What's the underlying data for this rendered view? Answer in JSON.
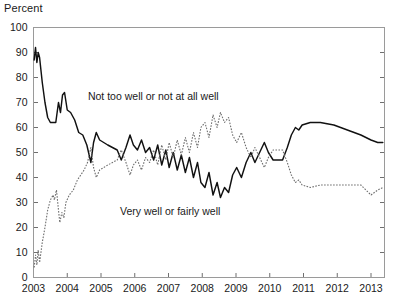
{
  "chart_data": {
    "type": "line",
    "title": "",
    "ylabel": "Percent",
    "xlabel": "",
    "ylim": [
      0,
      100
    ],
    "xlim": [
      2003.0,
      2013.4
    ],
    "grid": false,
    "legend_position": "inline-annotations",
    "y_ticks": [
      0,
      10,
      20,
      30,
      40,
      50,
      60,
      70,
      80,
      90,
      100
    ],
    "y_tick_labels": [
      "0",
      "10",
      "20",
      "30",
      "40",
      "50",
      "60",
      "70",
      "80",
      "90",
      "100"
    ],
    "x_ticks": [
      2003,
      2004,
      2005,
      2006,
      2007,
      2008,
      2009,
      2010,
      2011,
      2012,
      2013
    ],
    "x_tick_labels": [
      "2003",
      "2004",
      "2005",
      "2006",
      "2007",
      "2008",
      "2009",
      "2010",
      "2011",
      "2012",
      "2013"
    ],
    "annotations": [
      {
        "text": "Not too well or not at all well",
        "x": 2006.55,
        "y": 71
      },
      {
        "text": "Very well or fairly well",
        "x": 2007.05,
        "y": 25
      }
    ],
    "series": [
      {
        "name": "Not too well or not at all well",
        "style": "solid",
        "color": "#111111",
        "points": [
          [
            2003.02,
            87
          ],
          [
            2003.06,
            92
          ],
          [
            2003.1,
            86
          ],
          [
            2003.14,
            90
          ],
          [
            2003.18,
            88
          ],
          [
            2003.26,
            78
          ],
          [
            2003.34,
            70
          ],
          [
            2003.42,
            64
          ],
          [
            2003.5,
            62
          ],
          [
            2003.58,
            62
          ],
          [
            2003.66,
            62
          ],
          [
            2003.74,
            70
          ],
          [
            2003.8,
            66
          ],
          [
            2003.86,
            73
          ],
          [
            2003.92,
            74
          ],
          [
            2004.0,
            67
          ],
          [
            2004.1,
            66
          ],
          [
            2004.22,
            63
          ],
          [
            2004.34,
            58
          ],
          [
            2004.46,
            57
          ],
          [
            2004.58,
            53
          ],
          [
            2004.7,
            46
          ],
          [
            2004.78,
            54
          ],
          [
            2004.86,
            58
          ],
          [
            2004.96,
            55
          ],
          [
            2005.08,
            54
          ],
          [
            2005.2,
            53
          ],
          [
            2005.34,
            52
          ],
          [
            2005.48,
            51
          ],
          [
            2005.6,
            47
          ],
          [
            2005.74,
            52
          ],
          [
            2005.86,
            57
          ],
          [
            2005.96,
            53
          ],
          [
            2006.08,
            51
          ],
          [
            2006.2,
            55
          ],
          [
            2006.32,
            50
          ],
          [
            2006.44,
            52
          ],
          [
            2006.56,
            47
          ],
          [
            2006.68,
            53
          ],
          [
            2006.8,
            45
          ],
          [
            2006.92,
            51
          ],
          [
            2007.02,
            44
          ],
          [
            2007.14,
            50
          ],
          [
            2007.26,
            43
          ],
          [
            2007.38,
            49
          ],
          [
            2007.5,
            42
          ],
          [
            2007.62,
            48
          ],
          [
            2007.74,
            40
          ],
          [
            2007.86,
            46
          ],
          [
            2007.96,
            38
          ],
          [
            2008.08,
            36
          ],
          [
            2008.2,
            42
          ],
          [
            2008.32,
            33
          ],
          [
            2008.44,
            38
          ],
          [
            2008.54,
            32
          ],
          [
            2008.66,
            36
          ],
          [
            2008.78,
            34
          ],
          [
            2008.9,
            41
          ],
          [
            2009.02,
            44
          ],
          [
            2009.16,
            40
          ],
          [
            2009.3,
            46
          ],
          [
            2009.44,
            50
          ],
          [
            2009.56,
            46
          ],
          [
            2009.7,
            50
          ],
          [
            2009.84,
            54
          ],
          [
            2009.96,
            50
          ],
          [
            2010.1,
            47
          ],
          [
            2010.24,
            47
          ],
          [
            2010.38,
            47
          ],
          [
            2010.52,
            52
          ],
          [
            2010.64,
            57
          ],
          [
            2010.76,
            60
          ],
          [
            2010.86,
            59
          ],
          [
            2010.96,
            61
          ],
          [
            2011.2,
            62
          ],
          [
            2011.5,
            62
          ],
          [
            2011.9,
            61
          ],
          [
            2012.3,
            59
          ],
          [
            2012.7,
            57
          ],
          [
            2013.0,
            55
          ],
          [
            2013.2,
            54
          ],
          [
            2013.35,
            54
          ]
        ]
      },
      {
        "name": "Very well or fairly well",
        "style": "dotted",
        "color": "#6e6e6e",
        "points": [
          [
            2003.02,
            4
          ],
          [
            2003.06,
            9
          ],
          [
            2003.1,
            5
          ],
          [
            2003.14,
            11
          ],
          [
            2003.18,
            6
          ],
          [
            2003.26,
            14
          ],
          [
            2003.34,
            20
          ],
          [
            2003.42,
            27
          ],
          [
            2003.5,
            31
          ],
          [
            2003.58,
            33
          ],
          [
            2003.62,
            31
          ],
          [
            2003.68,
            35
          ],
          [
            2003.74,
            27
          ],
          [
            2003.78,
            22
          ],
          [
            2003.84,
            26
          ],
          [
            2003.9,
            24
          ],
          [
            2003.96,
            30
          ],
          [
            2004.06,
            33
          ],
          [
            2004.18,
            35
          ],
          [
            2004.3,
            39
          ],
          [
            2004.4,
            41
          ],
          [
            2004.5,
            43
          ],
          [
            2004.6,
            46
          ],
          [
            2004.7,
            52
          ],
          [
            2004.78,
            44
          ],
          [
            2004.86,
            40
          ],
          [
            2004.96,
            43
          ],
          [
            2005.08,
            44
          ],
          [
            2005.2,
            45
          ],
          [
            2005.34,
            46
          ],
          [
            2005.48,
            47
          ],
          [
            2005.6,
            51
          ],
          [
            2005.74,
            46
          ],
          [
            2005.86,
            41
          ],
          [
            2005.96,
            45
          ],
          [
            2006.08,
            47
          ],
          [
            2006.2,
            43
          ],
          [
            2006.32,
            48
          ],
          [
            2006.44,
            46
          ],
          [
            2006.56,
            51
          ],
          [
            2006.68,
            45
          ],
          [
            2006.8,
            53
          ],
          [
            2006.92,
            47
          ],
          [
            2007.02,
            54
          ],
          [
            2007.14,
            48
          ],
          [
            2007.26,
            55
          ],
          [
            2007.38,
            49
          ],
          [
            2007.5,
            56
          ],
          [
            2007.62,
            50
          ],
          [
            2007.74,
            58
          ],
          [
            2007.86,
            52
          ],
          [
            2007.96,
            60
          ],
          [
            2008.08,
            62
          ],
          [
            2008.2,
            56
          ],
          [
            2008.32,
            65
          ],
          [
            2008.44,
            60
          ],
          [
            2008.54,
            66
          ],
          [
            2008.66,
            62
          ],
          [
            2008.78,
            64
          ],
          [
            2008.9,
            57
          ],
          [
            2009.02,
            54
          ],
          [
            2009.16,
            58
          ],
          [
            2009.3,
            52
          ],
          [
            2009.44,
            48
          ],
          [
            2009.56,
            52
          ],
          [
            2009.7,
            48
          ],
          [
            2009.84,
            44
          ],
          [
            2009.96,
            48
          ],
          [
            2010.1,
            51
          ],
          [
            2010.24,
            51
          ],
          [
            2010.38,
            51
          ],
          [
            2010.52,
            46
          ],
          [
            2010.64,
            41
          ],
          [
            2010.76,
            38
          ],
          [
            2010.86,
            39
          ],
          [
            2010.96,
            37
          ],
          [
            2011.2,
            36
          ],
          [
            2011.5,
            37
          ],
          [
            2011.9,
            37
          ],
          [
            2012.3,
            37
          ],
          [
            2012.7,
            37
          ],
          [
            2013.0,
            33
          ],
          [
            2013.2,
            35
          ],
          [
            2013.35,
            36
          ]
        ]
      }
    ]
  }
}
